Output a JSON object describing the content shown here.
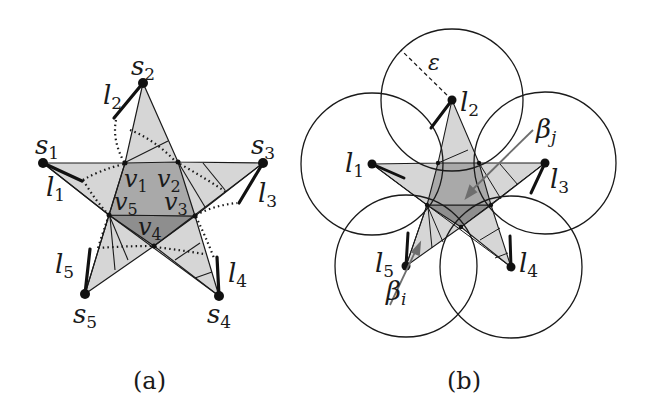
{
  "figure": {
    "panel_a": {
      "caption": "(a)",
      "star_tips": [
        {
          "name": "s",
          "sub": "1"
        },
        {
          "name": "s",
          "sub": "2"
        },
        {
          "name": "s",
          "sub": "3"
        },
        {
          "name": "s",
          "sub": "4"
        },
        {
          "name": "s",
          "sub": "5"
        }
      ],
      "segments": [
        {
          "name": "l",
          "sub": "1"
        },
        {
          "name": "l",
          "sub": "2"
        },
        {
          "name": "l",
          "sub": "3"
        },
        {
          "name": "l",
          "sub": "4"
        },
        {
          "name": "l",
          "sub": "5"
        }
      ],
      "inner_vertices": [
        {
          "name": "v",
          "sub": "1"
        },
        {
          "name": "v",
          "sub": "2"
        },
        {
          "name": "v",
          "sub": "3"
        },
        {
          "name": "v",
          "sub": "4"
        },
        {
          "name": "v",
          "sub": "5"
        }
      ]
    },
    "panel_b": {
      "caption": "(b)",
      "radius_label": "ε",
      "segments": [
        {
          "name": "l",
          "sub": "1"
        },
        {
          "name": "l",
          "sub": "2"
        },
        {
          "name": "l",
          "sub": "3"
        },
        {
          "name": "l",
          "sub": "4"
        },
        {
          "name": "l",
          "sub": "5"
        }
      ],
      "arrows": [
        {
          "name": "β",
          "sub": "j"
        },
        {
          "name": "β",
          "sub": "i"
        }
      ]
    },
    "colors": {
      "light_fill": "#d6d6d6",
      "mid_fill": "#a9a9a9",
      "dark_fill": "#8e8e8e",
      "stroke": "#1a1a1a",
      "arrow": "#6e6e6e"
    }
  }
}
